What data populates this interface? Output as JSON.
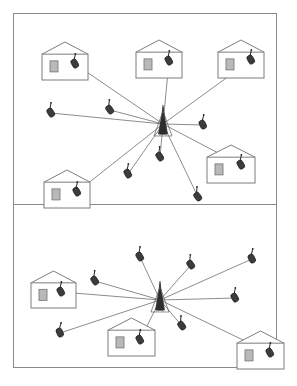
{
  "figure": {
    "panel_count": 2,
    "frame_color": "#8a8a8a",
    "background_color": "#ffffff",
    "line_color": "#6f6f6f",
    "outline_color": "#7d7d7d",
    "window_fill": "#b9b9b9",
    "mobile_fill": "#3c3c3c",
    "tower_fill": "#2e2e2e"
  },
  "panels": [
    {
      "id": "panel-top",
      "name": "upper-coverage-panel",
      "tower": {
        "name": "base-station-tower",
        "x": 149,
        "y": 110
      },
      "houses": [
        {
          "name": "house-top-left",
          "x": 28,
          "y": 28,
          "w": 46,
          "h": 38,
          "phone_dx": 33,
          "phone_dy": 22
        },
        {
          "name": "house-top-center",
          "x": 122,
          "y": 26,
          "w": 46,
          "h": 38,
          "phone_dx": 33,
          "phone_dy": 21
        },
        {
          "name": "house-top-right",
          "x": 204,
          "y": 26,
          "w": 46,
          "h": 38,
          "phone_dx": 33,
          "phone_dy": 20
        },
        {
          "name": "house-mid-right",
          "x": 193,
          "y": 131,
          "w": 48,
          "h": 38,
          "phone_dx": 34,
          "phone_dy": 20
        },
        {
          "name": "house-bottom-left",
          "x": 30,
          "y": 156,
          "w": 46,
          "h": 38,
          "phone_dx": 33,
          "phone_dy": 22
        }
      ],
      "mobiles": [
        {
          "name": "mobile-west",
          "x": 37,
          "y": 99
        },
        {
          "name": "mobile-north-west",
          "x": 96,
          "y": 96
        },
        {
          "name": "mobile-east",
          "x": 189,
          "y": 111
        },
        {
          "name": "mobile-south",
          "x": 146,
          "y": 143
        },
        {
          "name": "mobile-south-west",
          "x": 114,
          "y": 160
        },
        {
          "name": "mobile-south-east",
          "x": 184,
          "y": 183
        }
      ]
    },
    {
      "id": "panel-bottom",
      "name": "lower-coverage-panel",
      "tower": {
        "name": "base-station-tower",
        "x": 146,
        "y": 95
      },
      "houses": [
        {
          "name": "house-left",
          "x": 17,
          "y": 66,
          "w": 45,
          "h": 37,
          "phone_dx": 30,
          "phone_dy": 21
        },
        {
          "name": "house-center-bottom",
          "x": 94,
          "y": 113,
          "w": 47,
          "h": 38,
          "phone_dx": 32,
          "phone_dy": 22
        },
        {
          "name": "house-right-bottom",
          "x": 223,
          "y": 126,
          "w": 47,
          "h": 38,
          "phone_dx": 33,
          "phone_dy": 22
        }
      ],
      "mobiles": [
        {
          "name": "mobile-north",
          "x": 126,
          "y": 52
        },
        {
          "name": "mobile-north-east",
          "x": 177,
          "y": 60
        },
        {
          "name": "mobile-far-north-east",
          "x": 238,
          "y": 54
        },
        {
          "name": "mobile-west",
          "x": 81,
          "y": 76
        },
        {
          "name": "mobile-east",
          "x": 221,
          "y": 93
        },
        {
          "name": "mobile-south-east",
          "x": 168,
          "y": 121
        },
        {
          "name": "mobile-south-west",
          "x": 46,
          "y": 128
        }
      ]
    }
  ]
}
